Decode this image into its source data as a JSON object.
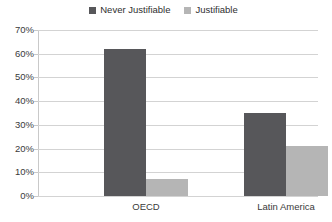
{
  "chart_data": {
    "type": "bar",
    "title": "",
    "subtitle": "",
    "xlabel": "",
    "ylabel": "",
    "categories": [
      "OECD",
      "Latin America"
    ],
    "series": [
      {
        "name": "Never Justifiable",
        "values": [
          62,
          35
        ],
        "color": "#57575a"
      },
      {
        "name": "Justifiable",
        "values": [
          7,
          21
        ],
        "color": "#b5b5b5"
      }
    ],
    "ylim": [
      0,
      70
    ],
    "ytick_labels": [
      "0%",
      "10%",
      "20%",
      "30%",
      "40%",
      "50%",
      "60%",
      "70%"
    ],
    "ytick_values": [
      0,
      10,
      20,
      30,
      40,
      50,
      60,
      70
    ],
    "grid": true,
    "legend_position": "top-center",
    "annotations": []
  },
  "legend": {
    "entries": [
      {
        "label": "Never Justifiable",
        "swatch": "legend-swatch-never-justifiable"
      },
      {
        "label": "Justifiable",
        "swatch": "legend-swatch-justifiable"
      }
    ]
  }
}
